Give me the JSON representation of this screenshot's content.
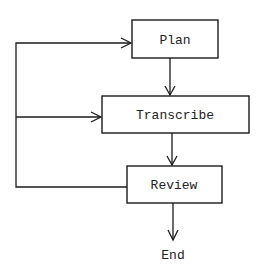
{
  "diagram": {
    "type": "flowchart",
    "nodes": [
      {
        "id": "plan",
        "label": "Plan"
      },
      {
        "id": "transcribe",
        "label": "Transcribe"
      },
      {
        "id": "review",
        "label": "Review"
      },
      {
        "id": "end",
        "label": "End"
      }
    ],
    "edges": [
      {
        "from": "plan",
        "to": "transcribe"
      },
      {
        "from": "transcribe",
        "to": "review"
      },
      {
        "from": "review",
        "to": "end"
      },
      {
        "from": "review",
        "to": "plan",
        "note": "feedback loop"
      },
      {
        "from": "review",
        "to": "transcribe",
        "note": "feedback loop"
      }
    ]
  },
  "colors": {
    "stroke": "#1a1a1a",
    "text": "#222222",
    "background": "#ffffff"
  }
}
